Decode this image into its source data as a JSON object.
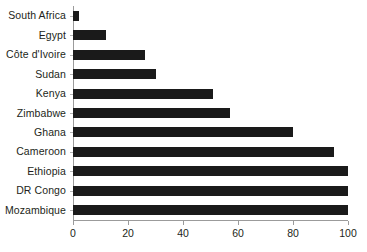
{
  "chart_data": {
    "type": "bar",
    "orientation": "horizontal",
    "title": "",
    "subtitle": "",
    "xlabel": "",
    "ylabel": "",
    "xlim": [
      0,
      100
    ],
    "grid": false,
    "legend": null,
    "bar_color": "#1a1a1a",
    "axis_color": "#9b9b9b",
    "text_color": "#231f20",
    "background": "#ffffff",
    "xticks": [
      0,
      20,
      40,
      60,
      80,
      100
    ],
    "xtick_labels": [
      "0",
      "20",
      "40",
      "60",
      "80",
      "100"
    ],
    "categories": [
      "South Africa",
      "Egypt",
      "Côte d'Ivoire",
      "Sudan",
      "Kenya",
      "Zimbabwe",
      "Ghana",
      "Cameroon",
      "Ethiopia",
      "DR Congo",
      "Mozambique"
    ],
    "values": [
      2,
      12,
      26,
      30,
      51,
      57,
      80,
      95,
      100,
      100,
      100
    ]
  }
}
